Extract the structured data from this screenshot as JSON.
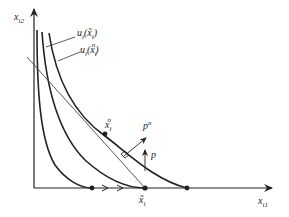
{
  "diagram": {
    "type": "indifference-curve-diagram",
    "axes": {
      "x_label": "x",
      "x_label_sub": "i1",
      "y_label": "x",
      "y_label_sub": "i2"
    },
    "curve_labels": [
      {
        "prefix": "u",
        "prefix_sub": "i",
        "arg": "x̃",
        "arg_sub": "i",
        "text": "u_i(x̃_i)"
      },
      {
        "prefix": "u",
        "prefix_sub": "i",
        "arg": "x",
        "arg_sub": "i",
        "arg_sup": "n",
        "text": "u_i(x_i^n)"
      }
    ],
    "points": [
      {
        "name": "x_i^n",
        "base": "x",
        "sub": "i",
        "sup": "n"
      },
      {
        "name": "x̃_i",
        "base": "x̃",
        "sub": "i"
      }
    ],
    "vectors": [
      {
        "name": "p^n",
        "base": "p",
        "sup": "n"
      },
      {
        "name": "p",
        "base": "p"
      }
    ],
    "colors": {
      "line": "#222222",
      "budget_line": "#444444",
      "background": "#ffffff"
    }
  }
}
